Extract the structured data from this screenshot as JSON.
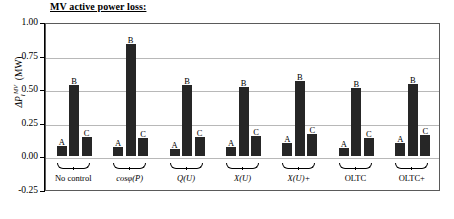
{
  "title": "MV active power loss:",
  "axis": {
    "y_title_parts": {
      "delta_p": "ΔP",
      "sub": "l",
      "sup": "MV",
      "unit": "(MW)"
    },
    "y_ticks": [
      "1.00",
      "0.75",
      "0.50",
      "0.25",
      "0.00",
      "-0.25"
    ]
  },
  "chart_data": {
    "type": "bar",
    "title": "MV active power loss:",
    "xlabel": "",
    "ylabel": "ΔP_l^MV (MW)",
    "ylim": [
      -0.25,
      1.0
    ],
    "ytick_values": [
      1.0,
      0.75,
      0.5,
      0.25,
      0.0,
      -0.25
    ],
    "grid": true,
    "legend": "none",
    "bar_labels": [
      "A",
      "B",
      "C"
    ],
    "categories": [
      "No control",
      "cosφ(P)",
      "Q(U)",
      "X(U)",
      "X(U)+",
      "OLTC",
      "OLTC+"
    ],
    "series": [
      {
        "name": "A",
        "values": [
          0.08,
          0.07,
          0.055,
          0.07,
          0.1,
          0.06,
          0.1
        ]
      },
      {
        "name": "B",
        "values": [
          0.53,
          0.84,
          0.53,
          0.52,
          0.56,
          0.51,
          0.54
        ]
      },
      {
        "name": "C",
        "values": [
          0.145,
          0.135,
          0.145,
          0.15,
          0.165,
          0.14,
          0.16
        ]
      }
    ]
  },
  "groups": [
    {
      "label": "No control",
      "italic": false
    },
    {
      "label": "cosφ(P)",
      "italic": true
    },
    {
      "label": "Q(U)",
      "italic": true
    },
    {
      "label": "X(U)",
      "italic": true
    },
    {
      "label": "X(U)+",
      "italic": true
    },
    {
      "label": "OLTC",
      "italic": false
    },
    {
      "label": "OLTC+",
      "italic": false
    }
  ]
}
